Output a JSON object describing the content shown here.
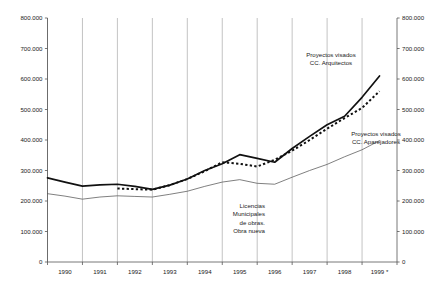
{
  "chart_data": {
    "type": "line",
    "title": "",
    "xlabel": "",
    "ylabel": "",
    "ylim": [
      0,
      800000
    ],
    "xlim": [
      1990,
      2000
    ],
    "grid": "vertical",
    "legend_position": "inline-annotations",
    "y_ticks": [
      "0",
      "100.000",
      "200.000",
      "300.000",
      "400.000",
      "500.000",
      "600.000",
      "700.000",
      "800.000"
    ],
    "y_tick_values": [
      0,
      100000,
      200000,
      300000,
      400000,
      500000,
      600000,
      700000,
      800000
    ],
    "categories": [
      "1990",
      "1991",
      "1992",
      "1993",
      "1994",
      "1995",
      "1996",
      "1997",
      "1998",
      "1999 *"
    ],
    "x_axis_note": "1999 *",
    "series": [
      {
        "name": "Proyectos visados CC. Arquitectos",
        "style": "solid-thick",
        "color": "#111111",
        "x": [
          1990.0,
          1990.5,
          1991.0,
          1991.5,
          1992.0,
          1992.5,
          1993.0,
          1993.5,
          1994.0,
          1994.5,
          1995.0,
          1995.5,
          1996.0,
          1996.5,
          1997.0,
          1997.5,
          1998.0,
          1998.5,
          1999.0,
          1999.5
        ],
        "values": [
          276000,
          262000,
          249000,
          253000,
          255000,
          248000,
          238000,
          252000,
          272000,
          300000,
          322000,
          352000,
          340000,
          327000,
          372000,
          412000,
          450000,
          478000,
          540000,
          610000
        ]
      },
      {
        "name": "Proyectos visados CC. Aparejadores",
        "style": "dotted-thick",
        "color": "#111111",
        "x": [
          1992.0,
          1992.5,
          1993.0,
          1993.5,
          1994.0,
          1994.5,
          1995.0,
          1995.5,
          1996.0,
          1996.5,
          1997.0,
          1997.5,
          1998.0,
          1998.5,
          1999.0,
          1999.5
        ],
        "values": [
          241000,
          239000,
          237000,
          252000,
          272000,
          298000,
          327000,
          322000,
          313000,
          335000,
          365000,
          400000,
          437000,
          472000,
          505000,
          560000
        ]
      },
      {
        "name": "Licencias Municipales de obras. Obra nueva",
        "style": "solid-thin",
        "color": "#555555",
        "x": [
          1990.0,
          1990.5,
          1991.0,
          1991.5,
          1992.0,
          1992.5,
          1993.0,
          1993.5,
          1994.0,
          1994.5,
          1995.0,
          1995.5,
          1996.0,
          1996.5,
          1997.0,
          1997.5,
          1998.0,
          1998.5,
          1999.0,
          1999.5
        ],
        "values": [
          224000,
          216000,
          206000,
          213000,
          217000,
          215000,
          213000,
          222000,
          232000,
          248000,
          262000,
          270000,
          258000,
          255000,
          278000,
          300000,
          320000,
          345000,
          368000,
          398000
        ]
      }
    ],
    "annotations": [
      {
        "id": "annot-arquitectos",
        "lines": [
          "Proyectos visados",
          "CC. Arquitectos"
        ],
        "align": "center"
      },
      {
        "id": "annot-aparejadores",
        "lines": [
          "Proyectos visados",
          "CC. Aparejadores"
        ],
        "align": "center"
      },
      {
        "id": "annot-licencias",
        "lines": [
          "Licencias",
          "Municipales",
          "de obras.",
          "Obra nueva"
        ],
        "align": "right"
      }
    ]
  }
}
